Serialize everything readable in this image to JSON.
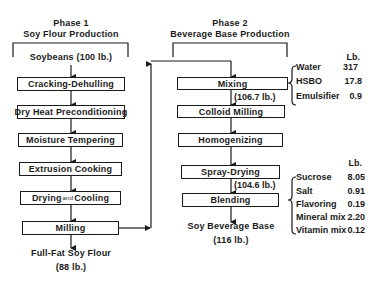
{
  "phase1": {
    "title": "Phase 1",
    "subtitle": "Soy Flour Production",
    "input": "Soybeans (100 lb.)",
    "steps": [
      {
        "label": "Cracking-Dehulling"
      },
      {
        "label": "Dry Heat Preconditioning"
      },
      {
        "label": "Moisture Tempering"
      },
      {
        "label": "Extrusion Cooking"
      },
      {
        "label_a": "Drying",
        "label_and": "and",
        "label_b": "Cooling"
      },
      {
        "label": "Milling"
      }
    ],
    "output_line1": "Full-Fat Soy Flour",
    "output_line2": "(88 lb.)"
  },
  "phase2": {
    "title": "Phase 2",
    "subtitle": "Beverage Base Production",
    "steps": [
      {
        "label": "Mixing"
      },
      {
        "label": "Colloid Milling"
      },
      {
        "label": "Homogenizing"
      },
      {
        "label": "Spray-Drying"
      },
      {
        "label": "Blending"
      }
    ],
    "mixing_output": "(106.7 lb.)",
    "spray_output": "(104.6 lb.)",
    "output_line1": "Soy Beverage Base",
    "output_line2": "(116 lb.)",
    "mixing_ingredients": {
      "unit": "Lb.",
      "items": [
        {
          "name": "Water",
          "value": "317"
        },
        {
          "name": "HSBO",
          "value": "17.8"
        },
        {
          "name": "Emulsifier",
          "value": "0.9"
        }
      ]
    },
    "blending_ingredients": {
      "unit": "Lb.",
      "items": [
        {
          "name": "Sucrose",
          "value": "8.05"
        },
        {
          "name": "Salt",
          "value": "0.91"
        },
        {
          "name": "Flavoring",
          "value": "0.19"
        },
        {
          "name": "Mineral mix",
          "value": "2.20"
        },
        {
          "name": "Vitamin mix",
          "value": "0.12"
        }
      ]
    }
  }
}
